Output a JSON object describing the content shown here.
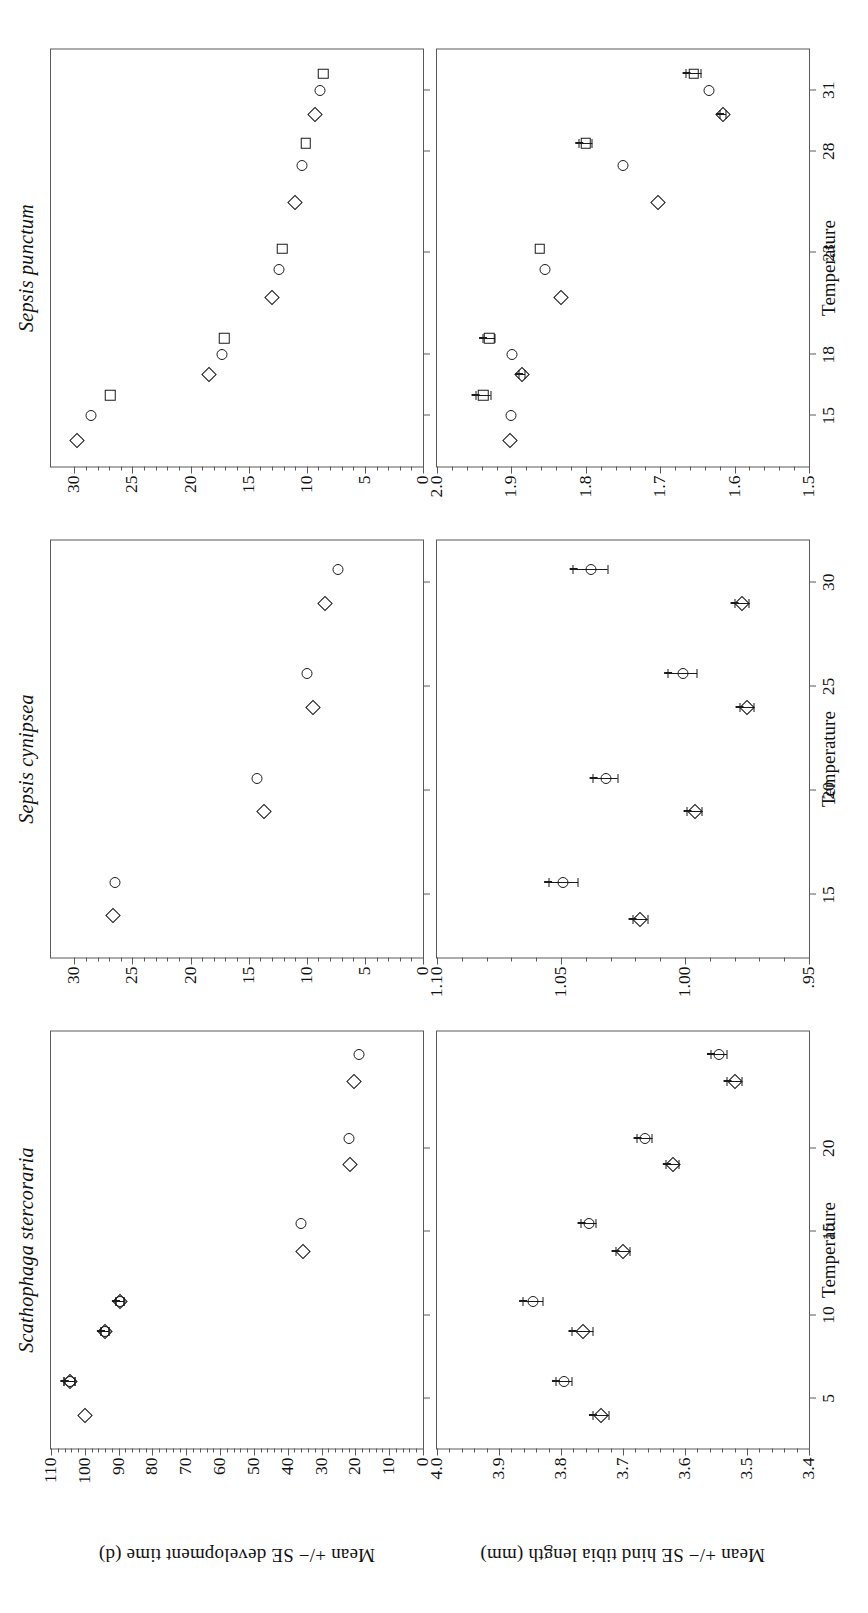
{
  "figure": {
    "axis_y_top": "Mean +/− SE development time (d)",
    "axis_y_bottom": "Mean +/− SE hind tibia length (mm)",
    "axis_x": "Temperature",
    "marker_colour": "#1b1b1b",
    "axis_colour": "#5a5a5a"
  },
  "columns": [
    {
      "species": "Scathophaga stercoraria"
    },
    {
      "species": "Sepsis cynipsea"
    },
    {
      "species": "Sepsis punctum"
    }
  ],
  "xticks": {
    "scathophaga": [
      "5",
      "10",
      "15",
      "20"
    ],
    "cynipsea": [
      "15",
      "20",
      "25",
      "30"
    ],
    "punctum": [
      "15",
      "18",
      "23",
      "28",
      "31"
    ]
  },
  "yticks": {
    "dev_scathophaga": [
      "0",
      "10",
      "20",
      "30",
      "40",
      "50",
      "60",
      "70",
      "80",
      "90",
      "100",
      "110"
    ],
    "dev_cynipsea": [
      "0",
      "5",
      "10",
      "15",
      "20",
      "25",
      "30"
    ],
    "dev_punctum": [
      "0",
      "5",
      "10",
      "15",
      "20",
      "25",
      "30"
    ],
    "tibia_scathophaga": [
      "3.4",
      "3.5",
      "3.6",
      "3.7",
      "3.8",
      "3.9",
      "4.0"
    ],
    "tibia_cynipsea": [
      ".95",
      "1.00",
      "1.05",
      "1.10"
    ],
    "tibia_punctum": [
      "1.5",
      "1.6",
      "1.7",
      "1.8",
      "1.9",
      "2.0"
    ]
  },
  "chart_data": [
    {
      "id": "dev-scathophaga",
      "type": "scatter",
      "title": "Scathophaga stercoraria",
      "xlabel": "Temperature",
      "ylabel": "Mean +/− SE development time (d)",
      "xlim": [
        2,
        27
      ],
      "ylim": [
        0,
        110
      ],
      "grid": false,
      "legend": "none",
      "series": [
        {
          "name": "female",
          "marker": "circle",
          "x": [
            6.0,
            9.0,
            10.8,
            15.5,
            20.6,
            25.6
          ],
          "y": [
            104.5,
            94.0,
            89.5,
            36.0,
            22.0,
            19.0
          ],
          "yerr": [
            1.6,
            1.2,
            1.2,
            0.0,
            0.0,
            0.0
          ]
        },
        {
          "name": "male",
          "marker": "diamond",
          "x": [
            4.0,
            6.0,
            9.0,
            10.8,
            13.8,
            19.0,
            24.0
          ],
          "y": [
            100.0,
            104.5,
            94.0,
            89.5,
            35.5,
            21.5,
            20.5
          ],
          "yerr": [
            0.0,
            1.6,
            1.2,
            1.2,
            0.0,
            0.0,
            0.0
          ]
        }
      ]
    },
    {
      "id": "tibia-scathophaga",
      "type": "scatter",
      "title": "Scathophaga stercoraria",
      "xlabel": "Temperature",
      "ylabel": "Mean +/− SE hind tibia length (mm)",
      "xlim": [
        2,
        27
      ],
      "ylim": [
        3.4,
        4.0
      ],
      "grid": false,
      "legend": "none",
      "series": [
        {
          "name": "female",
          "marker": "circle",
          "x": [
            6.0,
            10.8,
            15.5,
            20.6,
            25.6
          ],
          "y": [
            3.795,
            3.845,
            3.755,
            3.665,
            3.545
          ],
          "yerr": [
            0.013,
            0.016,
            0.012,
            0.012,
            0.013
          ]
        },
        {
          "name": "male",
          "marker": "diamond",
          "x": [
            4.0,
            9.0,
            13.8,
            19.0,
            24.0
          ],
          "y": [
            3.735,
            3.765,
            3.7,
            3.62,
            3.52
          ],
          "yerr": [
            0.013,
            0.017,
            0.012,
            0.01,
            0.012
          ]
        }
      ]
    },
    {
      "id": "dev-cynipsea",
      "type": "scatter",
      "title": "Sepsis cynipsea",
      "xlabel": "Temperature",
      "ylabel": "Mean +/− SE development time (d)",
      "xlim": [
        12,
        32
      ],
      "ylim": [
        0,
        32
      ],
      "grid": false,
      "legend": "none",
      "series": [
        {
          "name": "female",
          "marker": "circle",
          "x": [
            15.6,
            20.6,
            25.6,
            30.6
          ],
          "y": [
            26.5,
            14.3,
            10.0,
            7.3
          ],
          "yerr": [
            0.0,
            0.0,
            0.0,
            0.0
          ]
        },
        {
          "name": "male",
          "marker": "diamond",
          "x": [
            14.0,
            19.0,
            24.0,
            29.0
          ],
          "y": [
            26.7,
            13.7,
            9.5,
            8.4
          ],
          "yerr": [
            0.0,
            0.0,
            0.0,
            0.0
          ]
        }
      ]
    },
    {
      "id": "tibia-cynipsea",
      "type": "scatter",
      "title": "Sepsis cynipsea",
      "xlabel": "Temperature",
      "ylabel": "Mean +/− SE hind tibia length (mm)",
      "xlim": [
        12,
        32
      ],
      "ylim": [
        0.95,
        1.1
      ],
      "grid": false,
      "legend": "none",
      "series": [
        {
          "name": "female",
          "marker": "circle",
          "x": [
            15.6,
            20.6,
            25.6,
            30.6
          ],
          "y": [
            1.049,
            1.032,
            1.001,
            1.038
          ],
          "yerr": [
            0.006,
            0.005,
            0.006,
            0.007
          ]
        },
        {
          "name": "male",
          "marker": "diamond",
          "x": [
            13.8,
            19.0,
            24.0,
            29.0
          ],
          "y": [
            1.018,
            0.996,
            0.975,
            0.977
          ],
          "yerr": [
            0.003,
            0.003,
            0.003,
            0.003
          ]
        }
      ]
    },
    {
      "id": "dev-punctum",
      "type": "scatter",
      "title": "Sepsis punctum",
      "xlabel": "Temperature",
      "ylabel": "Mean +/− SE development time (d)",
      "xlim": [
        12.5,
        33
      ],
      "ylim": [
        0,
        32
      ],
      "grid": false,
      "legend": "none",
      "series": [
        {
          "name": "small male",
          "marker": "diamond",
          "x": [
            13.8,
            17.0,
            20.8,
            25.5,
            29.8
          ],
          "y": [
            29.8,
            18.4,
            13.0,
            11.0,
            9.3
          ],
          "yerr": [
            0,
            0,
            0,
            0,
            0
          ]
        },
        {
          "name": "female",
          "marker": "circle",
          "x": [
            15.0,
            18.0,
            22.2,
            27.3,
            31.0
          ],
          "y": [
            28.6,
            17.3,
            12.4,
            10.4,
            8.9
          ],
          "yerr": [
            0,
            0,
            0,
            0,
            0
          ]
        },
        {
          "name": "large male",
          "marker": "square",
          "x": [
            16.0,
            18.8,
            23.2,
            28.4,
            31.8
          ],
          "y": [
            26.9,
            17.1,
            12.1,
            10.1,
            8.6
          ],
          "yerr": [
            0,
            0,
            0,
            0,
            0
          ]
        }
      ]
    },
    {
      "id": "tibia-punctum",
      "type": "scatter",
      "title": "Sepsis punctum",
      "xlabel": "Temperature",
      "ylabel": "Mean +/− SE hind tibia length (mm)",
      "xlim": [
        12.5,
        33
      ],
      "ylim": [
        1.5,
        2.0
      ],
      "grid": false,
      "legend": "none",
      "series": [
        {
          "name": "small male",
          "marker": "diamond",
          "x": [
            13.8,
            17.0,
            20.8,
            25.5,
            29.8
          ],
          "y": [
            1.902,
            1.886,
            1.833,
            1.703,
            1.615
          ],
          "yerr": [
            0.0,
            0.004,
            0.0,
            0.0,
            0.004
          ]
        },
        {
          "name": "female",
          "marker": "circle",
          "x": [
            15.0,
            18.0,
            22.2,
            27.3,
            31.0
          ],
          "y": [
            1.9,
            1.899,
            1.855,
            1.75,
            1.635
          ],
          "yerr": [
            0.0,
            0.0,
            0.0,
            0.0,
            0.0
          ]
        },
        {
          "name": "large male",
          "marker": "square",
          "x": [
            16.0,
            18.8,
            23.2,
            28.4,
            31.8
          ],
          "y": [
            1.938,
            1.93,
            1.862,
            1.8,
            1.655
          ],
          "yerr": [
            0.01,
            0.008,
            0.0,
            0.009,
            0.01
          ]
        }
      ]
    }
  ]
}
